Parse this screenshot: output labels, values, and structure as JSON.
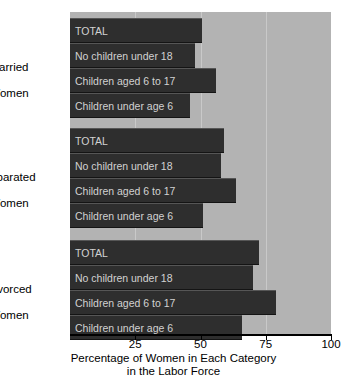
{
  "chart_data": {
    "type": "bar",
    "orientation": "horizontal",
    "title": "",
    "xlabel": "Percentage of Women in Each Category in the Labor Force",
    "ylabel": "",
    "xlim": [
      0,
      100
    ],
    "xticks": [
      25,
      50,
      75,
      100
    ],
    "xticklabels": [
      "25",
      "50",
      "75",
      "100"
    ],
    "grid": true,
    "legend": "none",
    "groups": [
      {
        "label": "Married\nWomen",
        "label_line1": "Married",
        "label_line2": "Women",
        "categories": [
          "TOTAL",
          "No children under 18",
          "Children aged 6 to 17",
          "Children under age 6"
        ],
        "values": [
          50.5,
          48.0,
          56.0,
          46.0
        ]
      },
      {
        "label": "Separated\nWomen",
        "label_line1": "Separated",
        "label_line2": "Women",
        "categories": [
          "TOTAL",
          "No children under 18",
          "Children aged 6 to 17",
          "Children under age 6"
        ],
        "values": [
          59.0,
          58.0,
          63.5,
          51.0
        ]
      },
      {
        "label": "Divorced\nWomen",
        "label_line1": "Divorced",
        "label_line2": "Women",
        "categories": [
          "TOTAL",
          "No children under 18",
          "Children aged 6 to 17",
          "Children under age 6"
        ],
        "values": [
          72.5,
          70.0,
          79.0,
          66.0
        ]
      }
    ],
    "colors": {
      "bar": "#2e2e2e",
      "plot_background": "#b3b3b3",
      "gridline": "#c9c9c9",
      "bar_label_text": "#d2d2d2",
      "axis": "#000000",
      "page_background": "#ffffff"
    }
  },
  "axis": {
    "title_line1": "Percentage of Women in Each Category",
    "title_line2": "in the Labor Force"
  },
  "groups": {
    "married": {
      "label_line1": "Married",
      "label_line2": "Women",
      "bars": [
        {
          "label": "TOTAL",
          "value": 50.5
        },
        {
          "label": "No children under 18",
          "value": 48.0
        },
        {
          "label": "Children aged 6 to 17",
          "value": 56.0
        },
        {
          "label": "Children under age 6",
          "value": 46.0
        }
      ]
    },
    "separated": {
      "label_line1": "Separated",
      "label_line2": "Women",
      "bars": [
        {
          "label": "TOTAL",
          "value": 59.0
        },
        {
          "label": "No children under 18",
          "value": 58.0
        },
        {
          "label": "Children aged 6 to 17",
          "value": 63.5
        },
        {
          "label": "Children under age 6",
          "value": 51.0
        }
      ]
    },
    "divorced": {
      "label_line1": "Divorced",
      "label_line2": "Women",
      "bars": [
        {
          "label": "TOTAL",
          "value": 72.5
        },
        {
          "label": "No children under 18",
          "value": 70.0
        },
        {
          "label": "Children aged 6 to 17",
          "value": 79.0
        },
        {
          "label": "Children under age 6",
          "value": 66.0
        }
      ]
    }
  },
  "ticks": [
    {
      "label": "25",
      "value": 25
    },
    {
      "label": "50",
      "value": 50
    },
    {
      "label": "75",
      "value": 75
    },
    {
      "label": "100",
      "value": 100
    }
  ]
}
